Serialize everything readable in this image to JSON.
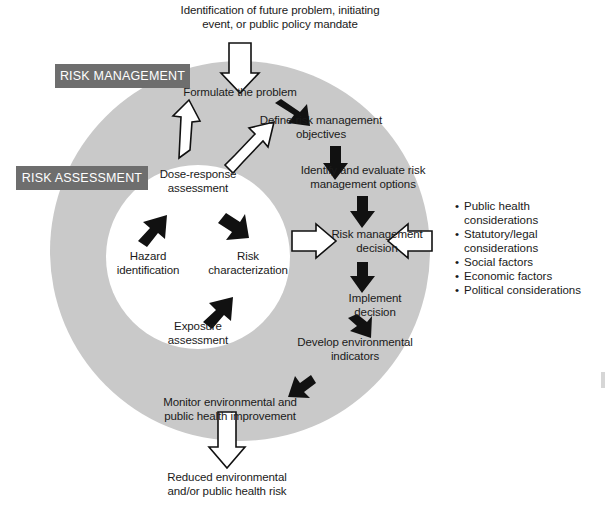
{
  "diagram": {
    "type": "risk-management-risk-assessment-cycle",
    "colors": {
      "outer_ring": "#c9c9c9",
      "inner_disc": "#ffffff",
      "tag_box": "#6e6e6e",
      "tag_text": "#ffffff",
      "solid_arrow": "#111111",
      "hollow_arrow_fill": "#ffffff",
      "hollow_arrow_stroke": "#111111",
      "text": "#1a1a1a",
      "background": "#ffffff"
    }
  },
  "tags": {
    "risk_management": "RISK MANAGEMENT",
    "risk_assessment": "RISK ASSESSMENT"
  },
  "inputs": {
    "top_trigger": "Identification of future problem, initiating\nevent, or public policy mandate"
  },
  "outputs": {
    "bottom_outcome": "Reduced environmental\nand/or public health risk"
  },
  "outer_cycle": {
    "title": "Risk management cycle",
    "steps": [
      {
        "id": "formulate",
        "label": "Formulate the problem"
      },
      {
        "id": "define-objectives",
        "label": "Define risk management\nobjectives"
      },
      {
        "id": "identify-options",
        "label": "Identify and evaluate risk\nmanagement options"
      },
      {
        "id": "decision",
        "label": "Risk management\ndecision"
      },
      {
        "id": "implement",
        "label": "Implement\ndecision"
      },
      {
        "id": "indicators",
        "label": "Develop environmental\nindicators"
      },
      {
        "id": "monitor",
        "label": "Monitor environmental and\npublic health improvement"
      }
    ]
  },
  "inner_cycle": {
    "title": "Risk assessment cycle",
    "steps": [
      {
        "id": "dose-response",
        "label": "Dose-response\nassessment"
      },
      {
        "id": "risk-characterization",
        "label": "Risk\ncharacterization"
      },
      {
        "id": "exposure",
        "label": "Exposure\nassessment"
      },
      {
        "id": "hazard",
        "label": "Hazard\nidentification"
      }
    ]
  },
  "considerations": {
    "title": "Risk management decision inputs",
    "items": [
      "Public health considerations",
      "Statutory/legal\nconsiderations",
      "Social factors",
      "Economic factors",
      "Political considerations"
    ]
  }
}
